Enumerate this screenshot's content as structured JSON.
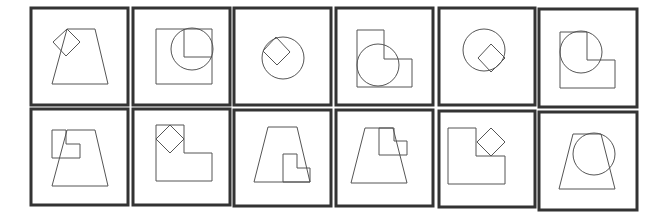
{
  "canvas": {
    "width": 659,
    "height": 216,
    "background": "#ffffff"
  },
  "colors": {
    "frame": "#333333",
    "stroke": "#555555"
  },
  "panels": [
    {
      "id": "r1c1",
      "frame": [
        31,
        8,
        97,
        97
      ],
      "shapes": [
        {
          "type": "trapezoid",
          "points": [
            [
              67,
              29
            ],
            [
              95,
              29
            ],
            [
              108,
              84
            ],
            [
              52,
              84
            ]
          ]
        },
        {
          "type": "diamond",
          "points": [
            [
              67,
              29
            ],
            [
              80,
              42
            ],
            [
              66,
              56
            ],
            [
              53,
              42
            ]
          ]
        }
      ]
    },
    {
      "id": "r1c2",
      "frame": [
        133,
        8,
        97,
        97
      ],
      "shapes": [
        {
          "type": "square",
          "points": [
            [
              156,
              29
            ],
            [
              212,
              29
            ],
            [
              212,
              84
            ],
            [
              156,
              84
            ]
          ]
        },
        {
          "type": "circle",
          "cx": 192,
          "cy": 49,
          "r": 21
        },
        {
          "type": "polyline",
          "points": [
            [
              184,
              29
            ],
            [
              184,
              57
            ],
            [
              212,
              57
            ]
          ]
        }
      ]
    },
    {
      "id": "r1c3",
      "frame": [
        234,
        8,
        97,
        97
      ],
      "shapes": [
        {
          "type": "circle",
          "cx": 283,
          "cy": 58,
          "r": 21
        },
        {
          "type": "diamond",
          "points": [
            [
              276,
              37
            ],
            [
              290,
              52
            ],
            [
              277,
              65
            ],
            [
              263,
              51
            ]
          ]
        }
      ]
    },
    {
      "id": "r1c4",
      "frame": [
        336,
        8,
        97,
        97
      ],
      "shapes": [
        {
          "type": "l-shape",
          "points": [
            [
              357,
              30
            ],
            [
              384,
              30
            ],
            [
              384,
              59
            ],
            [
              412,
              59
            ],
            [
              412,
              87
            ],
            [
              357,
              87
            ]
          ]
        },
        {
          "type": "circle",
          "cx": 378,
          "cy": 65,
          "r": 21
        }
      ]
    },
    {
      "id": "r1c5",
      "frame": [
        439,
        8,
        96,
        97
      ],
      "shapes": [
        {
          "type": "circle",
          "cx": 484,
          "cy": 50,
          "r": 21
        },
        {
          "type": "diamond",
          "points": [
            [
              491,
              44
            ],
            [
              505,
              58
            ],
            [
              491,
              72
            ],
            [
              478,
              58
            ]
          ]
        }
      ]
    },
    {
      "id": "r1c6",
      "frame": [
        539,
        9,
        98,
        98
      ],
      "shapes": [
        {
          "type": "l-shape",
          "points": [
            [
              560,
              32
            ],
            [
              587,
              32
            ],
            [
              587,
              60
            ],
            [
              615,
              60
            ],
            [
              615,
              88
            ],
            [
              560,
              88
            ]
          ]
        },
        {
          "type": "circle",
          "cx": 581,
          "cy": 52,
          "r": 21
        }
      ]
    },
    {
      "id": "r2c1",
      "frame": [
        31,
        109,
        97,
        96
      ],
      "shapes": [
        {
          "type": "trapezoid",
          "points": [
            [
              67,
              130
            ],
            [
              95,
              130
            ],
            [
              108,
              186
            ],
            [
              52,
              186
            ]
          ]
        },
        {
          "type": "l-shape",
          "points": [
            [
              52,
              130
            ],
            [
              66,
              130
            ],
            [
              66,
              144
            ],
            [
              80,
              144
            ],
            [
              80,
              158
            ],
            [
              52,
              158
            ]
          ]
        }
      ]
    },
    {
      "id": "r2c2",
      "frame": [
        133,
        109,
        97,
        96
      ],
      "shapes": [
        {
          "type": "l-shape",
          "points": [
            [
              156,
              125
            ],
            [
              184,
              125
            ],
            [
              184,
              153
            ],
            [
              212,
              153
            ],
            [
              212,
              181
            ],
            [
              156,
              181
            ]
          ]
        },
        {
          "type": "diamond",
          "points": [
            [
              170,
              125
            ],
            [
              184,
              139
            ],
            [
              170,
              153
            ],
            [
              156,
              139
            ]
          ]
        }
      ]
    },
    {
      "id": "r2c3",
      "frame": [
        234,
        110,
        97,
        96
      ],
      "shapes": [
        {
          "type": "trapezoid",
          "points": [
            [
              268,
              127
            ],
            [
              297,
              127
            ],
            [
              310,
              182
            ],
            [
              254,
              182
            ]
          ]
        },
        {
          "type": "l-shape",
          "points": [
            [
              283,
              154
            ],
            [
              297,
              154
            ],
            [
              297,
              168
            ],
            [
              310,
              168
            ],
            [
              310,
              182
            ],
            [
              283,
              182
            ]
          ]
        }
      ]
    },
    {
      "id": "r2c4",
      "frame": [
        336,
        110,
        97,
        96
      ],
      "shapes": [
        {
          "type": "trapezoid",
          "points": [
            [
              365,
              128
            ],
            [
              393,
              128
            ],
            [
              407,
              183
            ],
            [
              351,
              183
            ]
          ]
        },
        {
          "type": "l-shape",
          "points": [
            [
              379,
              128
            ],
            [
              394,
              128
            ],
            [
              394,
              141
            ],
            [
              407,
              141
            ],
            [
              407,
              155
            ],
            [
              379,
              155
            ]
          ]
        }
      ]
    },
    {
      "id": "r2c5",
      "frame": [
        439,
        111,
        96,
        96
      ],
      "shapes": [
        {
          "type": "l-shape",
          "points": [
            [
              448,
              128
            ],
            [
              476,
              128
            ],
            [
              476,
              156
            ],
            [
              505,
              156
            ],
            [
              505,
              184
            ],
            [
              448,
              184
            ]
          ]
        },
        {
          "type": "diamond",
          "points": [
            [
              491,
              128
            ],
            [
              505,
              142
            ],
            [
              491,
              156
            ],
            [
              477,
              142
            ]
          ]
        }
      ]
    },
    {
      "id": "r2c6",
      "frame": [
        539,
        112,
        98,
        98
      ],
      "shapes": [
        {
          "type": "trapezoid",
          "points": [
            [
              573,
              134
            ],
            [
              601,
              134
            ],
            [
              615,
              189
            ],
            [
              559,
              189
            ]
          ]
        },
        {
          "type": "circle",
          "cx": 594,
          "cy": 154,
          "r": 21
        }
      ]
    }
  ]
}
